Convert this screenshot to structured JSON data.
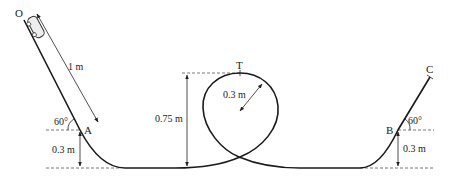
{
  "diagram": {
    "type": "roller-coaster-track-with-loop",
    "points": {
      "O": "O",
      "A": "A",
      "T": "T",
      "B": "B",
      "C": "C"
    },
    "labels": {
      "incline_length": "1 m",
      "angle_left": "60°",
      "height_A": "0.3 m",
      "loop_height": "0.75 m",
      "loop_radius": "0.3 m",
      "angle_right": "60°",
      "height_B": "0.3 m"
    },
    "colors": {
      "track": "#1a1a1a",
      "dashed": "#555555",
      "text": "#222222"
    }
  }
}
